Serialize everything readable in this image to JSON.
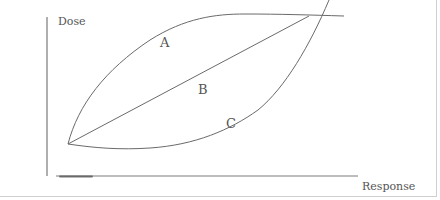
{
  "diagram": {
    "axes": {
      "y_label": "Dose",
      "x_label": "Response"
    },
    "curves": [
      {
        "id": "A",
        "label": "A",
        "shape": "concave (rises steeply then plateaus)"
      },
      {
        "id": "B",
        "label": "B",
        "shape": "linear"
      },
      {
        "id": "C",
        "label": "C",
        "shape": "convex (flat then rises steeply)"
      }
    ],
    "colors": {
      "line": "#6a6a6a",
      "text": "#555555",
      "border": "#cfcfcf"
    }
  }
}
